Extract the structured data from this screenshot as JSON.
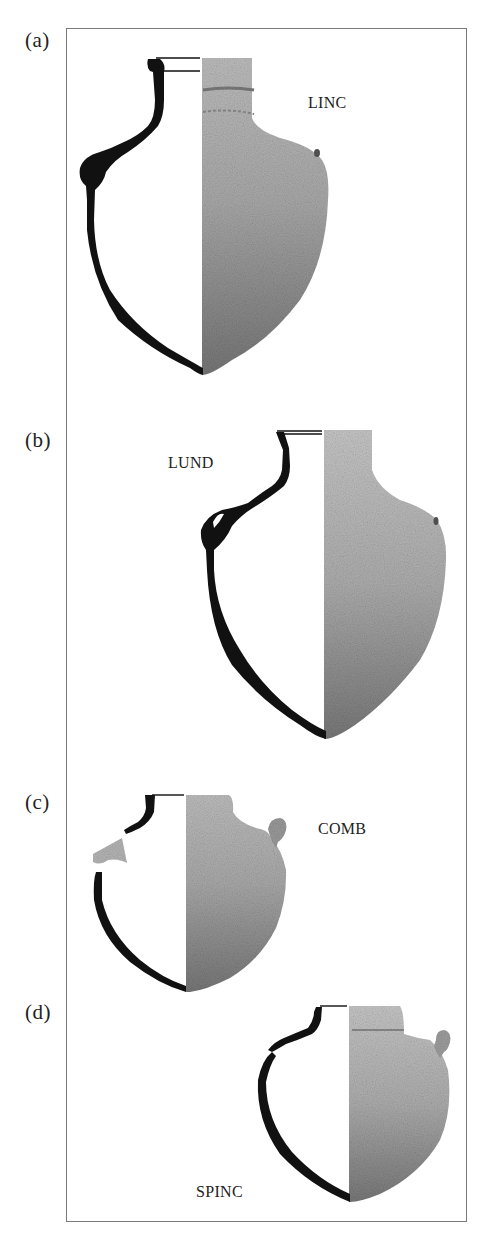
{
  "figure": {
    "panels": [
      {
        "id": "a",
        "label": "(a)",
        "type_label": "LINC"
      },
      {
        "id": "b",
        "label": "(b)",
        "type_label": "LUND"
      },
      {
        "id": "c",
        "label": "(c)",
        "type_label": "COMB"
      },
      {
        "id": "d",
        "label": "(d)",
        "type_label": "SPINC"
      }
    ],
    "colors": {
      "profile": "#111111",
      "frame": "#7a7a7a",
      "texture_light": "#c8c8c8",
      "texture_dark": "#6e6e6e"
    }
  }
}
